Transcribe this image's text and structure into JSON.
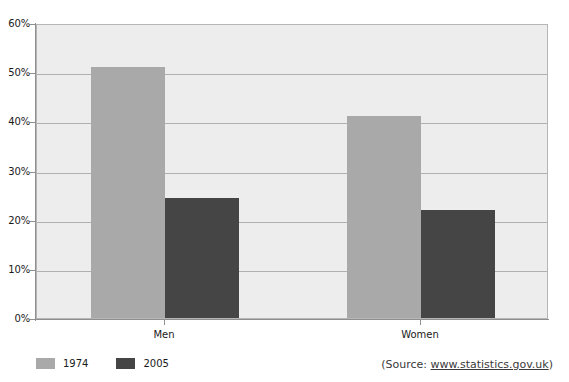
{
  "chart_data": {
    "type": "bar",
    "title": "",
    "xlabel": "",
    "ylabel": "",
    "categories": [
      "Men",
      "Women"
    ],
    "series": [
      {
        "name": "1974",
        "color": "#a9a9a9",
        "values": [
          51,
          41
        ]
      },
      {
        "name": "2005",
        "color": "#454545",
        "values": [
          24.5,
          22
        ]
      }
    ],
    "ylim": [
      0,
      60
    ],
    "ytick_labels": [
      "0%",
      "10%",
      "20%",
      "30%",
      "40%",
      "50%",
      "60%"
    ],
    "ytick_values": [
      0,
      10,
      20,
      30,
      40,
      50,
      60
    ],
    "grid": true,
    "legend_position": "bottom-left",
    "plot_background": "#ededed",
    "axis_color": "#8f8f8f",
    "gridline_color": "#b0b0b0"
  },
  "legend": {
    "items": [
      {
        "label": "1974",
        "color": "#a9a9a9"
      },
      {
        "label": "2005",
        "color": "#454545"
      }
    ]
  },
  "source": {
    "prefix": "(Source: ",
    "url": "www.statistics.gov.uk",
    "suffix": ")"
  }
}
